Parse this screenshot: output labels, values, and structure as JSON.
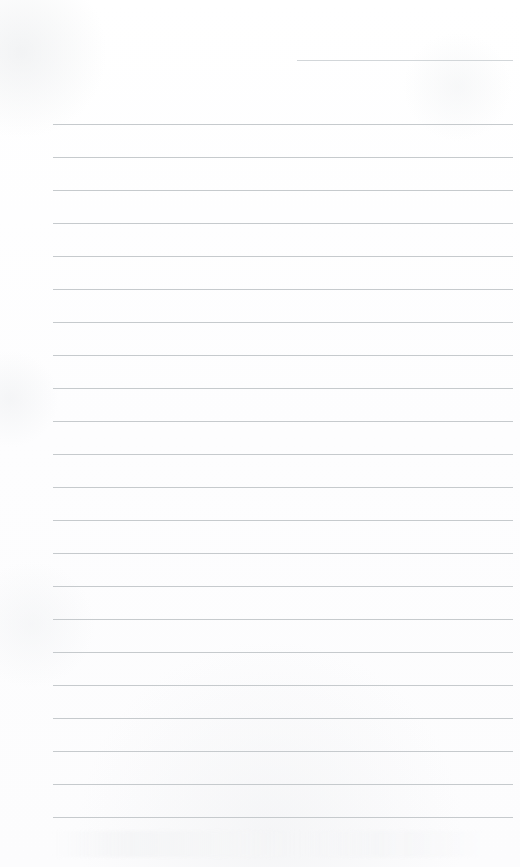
{
  "page": {
    "title": "Lined Notebook Page",
    "kind": "blank-ruled-paper",
    "width_px": 520,
    "height_px": 867,
    "background_color": "#fefefe",
    "rule_color": "#c6cacd",
    "rule_thickness_px": 1,
    "rule_spacing_px": 33,
    "content_text": "",
    "total_rules": 23,
    "notes_label": "",
    "header_label": ""
  },
  "rules": [
    {
      "id": "rule-header-short",
      "y": 60,
      "x_start": 297,
      "x_end": 513,
      "variant": "short"
    },
    {
      "id": "rule-1",
      "y": 124,
      "x_start": 53,
      "x_end": 513,
      "variant": "full"
    },
    {
      "id": "rule-2",
      "y": 157,
      "x_start": 53,
      "x_end": 513,
      "variant": "full"
    },
    {
      "id": "rule-3",
      "y": 190,
      "x_start": 53,
      "x_end": 513,
      "variant": "full"
    },
    {
      "id": "rule-4",
      "y": 223,
      "x_start": 53,
      "x_end": 513,
      "variant": "full"
    },
    {
      "id": "rule-5",
      "y": 256,
      "x_start": 53,
      "x_end": 513,
      "variant": "full"
    },
    {
      "id": "rule-6",
      "y": 289,
      "x_start": 53,
      "x_end": 513,
      "variant": "full"
    },
    {
      "id": "rule-7",
      "y": 322,
      "x_start": 53,
      "x_end": 513,
      "variant": "full"
    },
    {
      "id": "rule-8",
      "y": 355,
      "x_start": 53,
      "x_end": 513,
      "variant": "full"
    },
    {
      "id": "rule-9",
      "y": 388,
      "x_start": 53,
      "x_end": 513,
      "variant": "full"
    },
    {
      "id": "rule-10",
      "y": 421,
      "x_start": 53,
      "x_end": 513,
      "variant": "full"
    },
    {
      "id": "rule-11",
      "y": 454,
      "x_start": 53,
      "x_end": 513,
      "variant": "full"
    },
    {
      "id": "rule-12",
      "y": 487,
      "x_start": 53,
      "x_end": 513,
      "variant": "full"
    },
    {
      "id": "rule-13",
      "y": 520,
      "x_start": 53,
      "x_end": 513,
      "variant": "full"
    },
    {
      "id": "rule-14",
      "y": 553,
      "x_start": 53,
      "x_end": 513,
      "variant": "full"
    },
    {
      "id": "rule-15",
      "y": 586,
      "x_start": 53,
      "x_end": 513,
      "variant": "full"
    },
    {
      "id": "rule-16",
      "y": 619,
      "x_start": 53,
      "x_end": 513,
      "variant": "full"
    },
    {
      "id": "rule-17",
      "y": 652,
      "x_start": 53,
      "x_end": 513,
      "variant": "full"
    },
    {
      "id": "rule-18",
      "y": 685,
      "x_start": 53,
      "x_end": 513,
      "variant": "full"
    },
    {
      "id": "rule-19",
      "y": 718,
      "x_start": 53,
      "x_end": 513,
      "variant": "full"
    },
    {
      "id": "rule-20",
      "y": 751,
      "x_start": 53,
      "x_end": 513,
      "variant": "full"
    },
    {
      "id": "rule-21",
      "y": 784,
      "x_start": 53,
      "x_end": 513,
      "variant": "full"
    },
    {
      "id": "rule-22",
      "y": 817,
      "x_start": 53,
      "x_end": 513,
      "variant": "full"
    }
  ]
}
